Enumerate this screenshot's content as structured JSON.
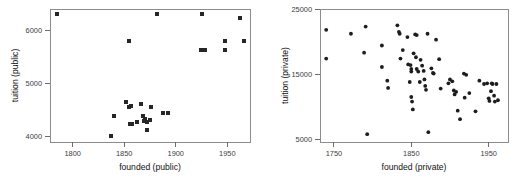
{
  "figure": {
    "title": "",
    "background_color": "#ffffff",
    "marker_color": "#262626",
    "axis_color": "#8c8c8c"
  },
  "panels": [
    {
      "id": "public",
      "xlabel": "founded (public)",
      "ylabel": "tuition (public)",
      "xticks": [
        "1800",
        "1850",
        "1900",
        "1950"
      ],
      "yticks": [
        "4000",
        "5000",
        "6000"
      ]
    },
    {
      "id": "private",
      "xlabel": "founded (private)",
      "ylabel": "tuition (private)",
      "xticks": [
        "1750",
        "1850",
        "1950"
      ],
      "yticks": [
        "5000",
        "15000",
        "25000"
      ]
    }
  ],
  "chart_data": [
    {
      "type": "scatter",
      "id": "public",
      "title": "",
      "xlabel": "founded (public)",
      "ylabel": "tuition (public)",
      "xticks": [
        1800,
        1850,
        1900,
        1950
      ],
      "yticks": [
        4000,
        5000,
        6000
      ],
      "xlim": [
        1778,
        1972
      ],
      "ylim": [
        3900,
        6400
      ],
      "grid": false,
      "legend": null,
      "marker": "square",
      "points": [
        {
          "x": 1785,
          "y": 6310
        },
        {
          "x": 1855,
          "y": 5790
        },
        {
          "x": 1882,
          "y": 6310
        },
        {
          "x": 1925,
          "y": 6310
        },
        {
          "x": 1962,
          "y": 6230
        },
        {
          "x": 1948,
          "y": 5800
        },
        {
          "x": 1966,
          "y": 5790
        },
        {
          "x": 1924,
          "y": 5620
        },
        {
          "x": 1928,
          "y": 5620
        },
        {
          "x": 1948,
          "y": 5620
        },
        {
          "x": 1837,
          "y": 4010
        },
        {
          "x": 1840,
          "y": 4390
        },
        {
          "x": 1852,
          "y": 4650
        },
        {
          "x": 1855,
          "y": 4560
        },
        {
          "x": 1857,
          "y": 4570
        },
        {
          "x": 1856,
          "y": 4240
        },
        {
          "x": 1858,
          "y": 4230
        },
        {
          "x": 1862,
          "y": 4270
        },
        {
          "x": 1866,
          "y": 4610
        },
        {
          "x": 1868,
          "y": 4380
        },
        {
          "x": 1869,
          "y": 4300
        },
        {
          "x": 1870,
          "y": 4330
        },
        {
          "x": 1872,
          "y": 4280
        },
        {
          "x": 1872,
          "y": 4120
        },
        {
          "x": 1875,
          "y": 4310
        },
        {
          "x": 1876,
          "y": 4560
        },
        {
          "x": 1888,
          "y": 4440
        },
        {
          "x": 1892,
          "y": 4440
        }
      ]
    },
    {
      "type": "scatter",
      "id": "private",
      "title": "",
      "xlabel": "founded (private)",
      "ylabel": "tuition (private)",
      "xticks": [
        1750,
        1850,
        1950
      ],
      "yticks": [
        5000,
        15000,
        25000
      ],
      "xlim": [
        1732,
        1975
      ],
      "ylim": [
        4600,
        25000
      ],
      "grid": false,
      "legend": null,
      "marker": "circle",
      "points": [
        {
          "x": 1740,
          "y": 21800
        },
        {
          "x": 1740,
          "y": 17400
        },
        {
          "x": 1772,
          "y": 21200
        },
        {
          "x": 1791,
          "y": 22300
        },
        {
          "x": 1789,
          "y": 18300
        },
        {
          "x": 1793,
          "y": 5800
        },
        {
          "x": 1812,
          "y": 19400
        },
        {
          "x": 1812,
          "y": 16100
        },
        {
          "x": 1819,
          "y": 14000
        },
        {
          "x": 1820,
          "y": 12900
        },
        {
          "x": 1832,
          "y": 22500
        },
        {
          "x": 1834,
          "y": 21500
        },
        {
          "x": 1835,
          "y": 21200
        },
        {
          "x": 1836,
          "y": 17400
        },
        {
          "x": 1839,
          "y": 18700
        },
        {
          "x": 1845,
          "y": 20700
        },
        {
          "x": 1846,
          "y": 16500
        },
        {
          "x": 1848,
          "y": 13800
        },
        {
          "x": 1849,
          "y": 16400
        },
        {
          "x": 1850,
          "y": 15800
        },
        {
          "x": 1850,
          "y": 15400
        },
        {
          "x": 1850,
          "y": 11500
        },
        {
          "x": 1851,
          "y": 10800
        },
        {
          "x": 1852,
          "y": 9600
        },
        {
          "x": 1853,
          "y": 18200
        },
        {
          "x": 1855,
          "y": 21100
        },
        {
          "x": 1857,
          "y": 21000
        },
        {
          "x": 1856,
          "y": 17600
        },
        {
          "x": 1857,
          "y": 15800
        },
        {
          "x": 1859,
          "y": 15400
        },
        {
          "x": 1861,
          "y": 13800
        },
        {
          "x": 1862,
          "y": 17200
        },
        {
          "x": 1864,
          "y": 16300
        },
        {
          "x": 1866,
          "y": 15500
        },
        {
          "x": 1867,
          "y": 14200
        },
        {
          "x": 1868,
          "y": 13200
        },
        {
          "x": 1869,
          "y": 12600
        },
        {
          "x": 1871,
          "y": 21200
        },
        {
          "x": 1872,
          "y": 6100
        },
        {
          "x": 1876,
          "y": 15900
        },
        {
          "x": 1878,
          "y": 15200
        },
        {
          "x": 1879,
          "y": 15100
        },
        {
          "x": 1882,
          "y": 20300
        },
        {
          "x": 1886,
          "y": 17300
        },
        {
          "x": 1888,
          "y": 12800
        },
        {
          "x": 1898,
          "y": 13600
        },
        {
          "x": 1900,
          "y": 14200
        },
        {
          "x": 1903,
          "y": 13900
        },
        {
          "x": 1905,
          "y": 12500
        },
        {
          "x": 1906,
          "y": 11900
        },
        {
          "x": 1908,
          "y": 12300
        },
        {
          "x": 1910,
          "y": 9400
        },
        {
          "x": 1913,
          "y": 8100
        },
        {
          "x": 1918,
          "y": 15100
        },
        {
          "x": 1919,
          "y": 11400
        },
        {
          "x": 1921,
          "y": 14900
        },
        {
          "x": 1925,
          "y": 12100
        },
        {
          "x": 1933,
          "y": 9300
        },
        {
          "x": 1938,
          "y": 14000
        },
        {
          "x": 1944,
          "y": 13500
        },
        {
          "x": 1948,
          "y": 13600
        },
        {
          "x": 1950,
          "y": 11300
        },
        {
          "x": 1951,
          "y": 10900
        },
        {
          "x": 1953,
          "y": 12400
        },
        {
          "x": 1954,
          "y": 13600
        },
        {
          "x": 1955,
          "y": 13500
        },
        {
          "x": 1957,
          "y": 11700
        },
        {
          "x": 1958,
          "y": 10800
        },
        {
          "x": 1960,
          "y": 13500
        },
        {
          "x": 1962,
          "y": 11000
        }
      ]
    }
  ]
}
